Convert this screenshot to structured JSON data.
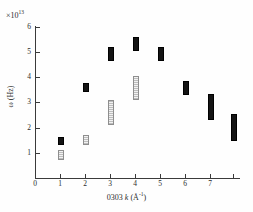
{
  "chart_data": {
    "type": "scatter",
    "title": "",
    "xlabel": "0303 k (Å⁻¹)",
    "ylabel": "ω (Hz)",
    "exponent_label": "×10¹³",
    "exponent_mantissa": "×10",
    "exponent_power": "13",
    "xlim": [
      0,
      8.3
    ],
    "ylim": [
      0,
      6.6
    ],
    "xticks": [
      0,
      1,
      2,
      3,
      4,
      5,
      6,
      7
    ],
    "xtick_labels": [
      "0",
      "1",
      "2",
      "3",
      "4",
      "5",
      "6",
      "7"
    ],
    "yticks": [
      1,
      2,
      3,
      4,
      5,
      6
    ],
    "ytick_labels": [
      "1",
      "2",
      "3",
      "4",
      "5",
      "6"
    ],
    "grid": false,
    "legend": "none",
    "marker_style": "vertical-bar-range",
    "series": [
      {
        "name": "upper-branch",
        "style": "solid",
        "color": "#141414",
        "points": [
          {
            "x": 1.0,
            "y": 1.52,
            "ymin": 1.4,
            "ymax": 1.64
          },
          {
            "x": 2.0,
            "y": 3.62,
            "ymin": 3.48,
            "ymax": 3.76
          },
          {
            "x": 3.0,
            "y": 4.95,
            "ymin": 4.72,
            "ymax": 5.18
          },
          {
            "x": 4.0,
            "y": 5.35,
            "ymin": 5.12,
            "ymax": 5.58
          },
          {
            "x": 5.0,
            "y": 4.95,
            "ymin": 4.72,
            "ymax": 5.18
          },
          {
            "x": 6.0,
            "y": 3.62,
            "ymin": 3.38,
            "ymax": 3.86
          },
          {
            "x": 7.0,
            "y": 2.86,
            "ymin": 2.38,
            "ymax": 3.34
          },
          {
            "x": 7.9,
            "y": 2.05,
            "ymin": 1.55,
            "ymax": 2.55
          }
        ]
      },
      {
        "name": "lower-branch",
        "style": "open",
        "color": "#bdbdbd",
        "points": [
          {
            "x": 1.0,
            "y": 0.95,
            "ymin": 0.8,
            "ymax": 1.1
          },
          {
            "x": 2.0,
            "y": 1.55,
            "ymin": 1.4,
            "ymax": 1.7
          },
          {
            "x": 3.0,
            "y": 2.65,
            "ymin": 2.2,
            "ymax": 3.1
          },
          {
            "x": 4.0,
            "y": 3.62,
            "ymin": 3.18,
            "ymax": 4.06
          }
        ]
      }
    ]
  }
}
